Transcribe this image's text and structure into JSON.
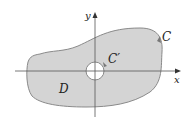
{
  "diagram": {
    "type": "region-with-hole",
    "labels": {
      "outer_curve": "C",
      "inner_curve": "C′",
      "region": "D",
      "x_axis": "x",
      "y_axis": "y"
    },
    "colors": {
      "region_fill": "#d4d4d4",
      "curve_stroke": "#8a8a8a",
      "axis_stroke": "#555555",
      "hole_fill": "#ffffff",
      "text": "#222222"
    }
  }
}
